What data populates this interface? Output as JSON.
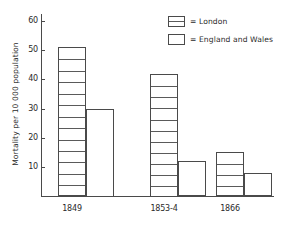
{
  "chart_data": {
    "type": "bar",
    "title": "",
    "subtitle": "",
    "xlabel": "",
    "ylabel": "Mortality per 10 000 population",
    "categories": [
      "1849",
      "1853-4",
      "1866"
    ],
    "series": [
      {
        "name": "London",
        "values": [
          51,
          42,
          15
        ],
        "style": "segmented-box"
      },
      {
        "name": "England and Wales",
        "values": [
          30,
          12,
          8
        ],
        "style": "plain-box"
      }
    ],
    "ylim": [
      0,
      60
    ],
    "yticks": [
      10,
      20,
      30,
      40,
      50,
      60
    ],
    "ytick_labels": [
      "10",
      "20",
      "30",
      "40",
      "50",
      "60"
    ],
    "grid": false,
    "legend_position": "top-right",
    "annotations": []
  },
  "axes": {
    "y_title": "Mortality per 10 000 population",
    "y_ticks": [
      {
        "value": 60,
        "label": "60"
      },
      {
        "value": 50,
        "label": "50"
      },
      {
        "value": 40,
        "label": "40"
      },
      {
        "value": 30,
        "label": "30"
      },
      {
        "value": 20,
        "label": "20"
      },
      {
        "value": 10,
        "label": "10"
      }
    ]
  },
  "groups": [
    {
      "label": "1849",
      "london": 51,
      "england_wales": 30
    },
    {
      "label": "1853-4",
      "london": 42,
      "england_wales": 12
    },
    {
      "label": "1866",
      "london": 15,
      "england_wales": 8
    }
  ],
  "legend": {
    "items": [
      {
        "equals": "=",
        "label": "London",
        "swatch": "segmented-box-icon"
      },
      {
        "equals": "=",
        "label": "England and Wales",
        "swatch": "empty-box-icon"
      }
    ]
  },
  "colors": {
    "ink": "#4a4a4a",
    "segment": "#5a5a5a",
    "background": "#ffffff"
  }
}
